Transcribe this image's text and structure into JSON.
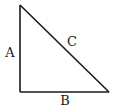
{
  "diagram": {
    "type": "right-triangle",
    "vertices": {
      "top": [
        20,
        5
      ],
      "right_angle": [
        20,
        92
      ],
      "bottom_right": [
        109,
        92
      ]
    },
    "stroke_color": "#1a1a1a",
    "labels": {
      "vertical_side": {
        "text": "A",
        "x": 10,
        "y": 52
      },
      "hypotenuse": {
        "text": "C",
        "x": 72,
        "y": 41
      },
      "horizontal_side": {
        "text": "B",
        "x": 65,
        "y": 100
      }
    }
  }
}
